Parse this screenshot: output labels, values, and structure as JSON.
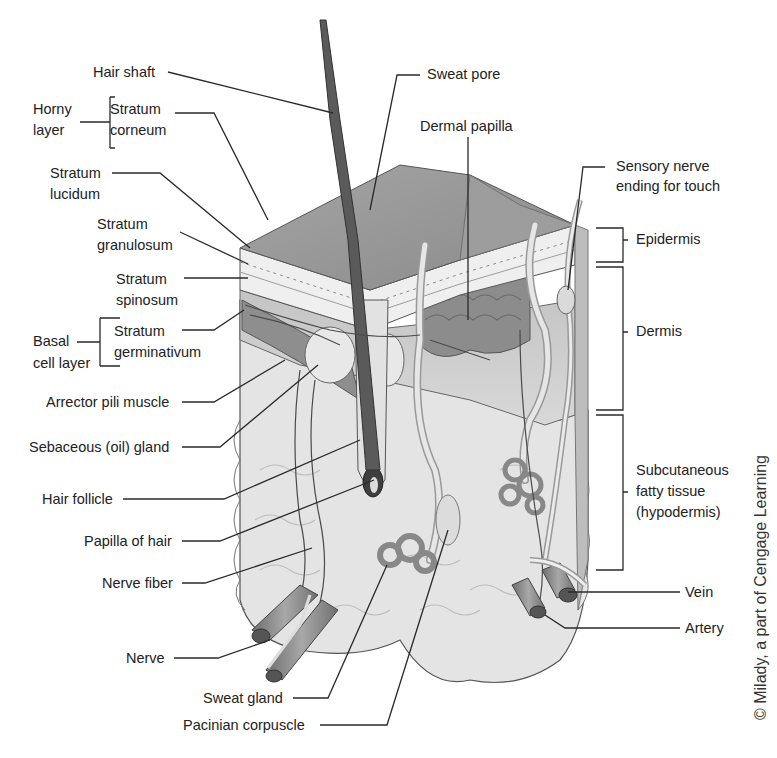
{
  "diagram": {
    "labels_left": {
      "hair_shaft": "Hair shaft",
      "horny_layer": [
        "Horny",
        "layer"
      ],
      "stratum_corneum": [
        "Stratum",
        "corneum"
      ],
      "stratum_lucidum": [
        "Stratum",
        "lucidum"
      ],
      "stratum_granulosum": [
        "Stratum",
        "granulosum"
      ],
      "stratum_spinosum": [
        "Stratum",
        "spinosum"
      ],
      "basal_cell_layer": [
        "Basal",
        "cell layer"
      ],
      "stratum_germinativum": [
        "Stratum",
        "germinativum"
      ],
      "arrector_pili_muscle": "Arrector pili muscle",
      "sebaceous_gland": "Sebaceous (oil) gland",
      "hair_follicle": "Hair follicle",
      "papilla_of_hair": "Papilla of hair",
      "nerve_fiber": "Nerve fiber",
      "nerve": "Nerve"
    },
    "labels_bottom": {
      "sweat_gland": "Sweat gland",
      "pacinian_corpuscle": "Pacinian corpuscle"
    },
    "labels_top": {
      "sweat_pore": "Sweat pore",
      "dermal_papilla": "Dermal papilla",
      "sensory_nerve": [
        "Sensory nerve",
        "ending for touch"
      ]
    },
    "labels_right": {
      "epidermis": "Epidermis",
      "dermis": "Dermis",
      "subcutaneous": [
        "Subcutaneous",
        "fatty tissue",
        "(hypodermis)"
      ],
      "vein": "Vein",
      "artery": "Artery"
    },
    "copyright": "© Milady, a part of Cengage Learning",
    "colors": {
      "background": "#ffffff",
      "line": "#2a2a2a",
      "epidermis_top": "#9a9a9a",
      "dermis": "#b8b8b8",
      "fat": "#e2e2e2",
      "hair": "#5a5a5a",
      "vessel": "#8a8a8a"
    }
  }
}
